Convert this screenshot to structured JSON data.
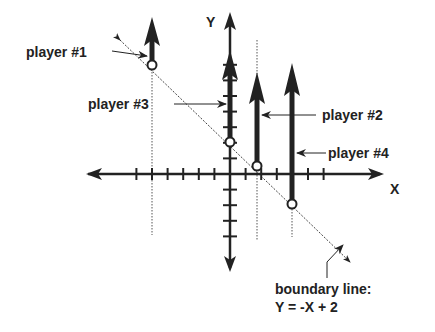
{
  "diagram": {
    "axes": {
      "x_label": "X",
      "y_label": "Y",
      "x_range": [
        -9,
        10
      ],
      "y_range": [
        -6,
        10
      ]
    },
    "boundary": {
      "label_line1": "boundary line:",
      "label_line2": "Y = -X + 2",
      "slope": -1,
      "intercept": 2
    },
    "players": [
      {
        "name": "player #1",
        "x": -5,
        "y": 7
      },
      {
        "name": "player #3",
        "x": 0,
        "y": 2
      },
      {
        "name": "player #2",
        "x": 1.7,
        "y": 0.5
      },
      {
        "name": "player #4",
        "x": 4,
        "y": -2
      }
    ],
    "colors": {
      "ink": "#222222",
      "background": "#ffffff"
    }
  }
}
